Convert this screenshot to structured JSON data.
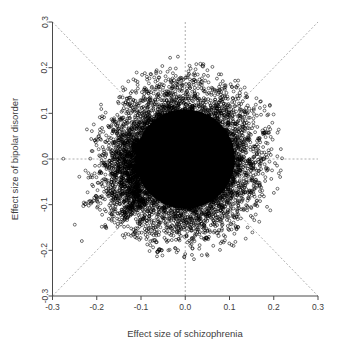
{
  "chart_data": {
    "type": "scatter",
    "title": "",
    "xlabel": "Effect size of schizophrenia",
    "ylabel": "Effect size of bipolar disorder",
    "xlim": [
      -0.3,
      0.3
    ],
    "ylim": [
      -0.3,
      0.3
    ],
    "xticks": [
      -0.3,
      -0.2,
      -0.1,
      0.0,
      0.1,
      0.2,
      0.3
    ],
    "yticks": [
      -0.3,
      -0.2,
      -0.1,
      0.0,
      0.1,
      0.2,
      0.3
    ],
    "xtick_labels": [
      "-0.3",
      "-0.2",
      "-0.1",
      "0.0",
      "0.1",
      "0.2",
      "0.3"
    ],
    "ytick_labels": [
      "-0.3",
      "-0.2",
      "-0.1",
      "0.0",
      "0.1",
      "0.2",
      "0.3"
    ],
    "grid": false,
    "legend": null,
    "marker": "open-circle",
    "marker_color": "#000000",
    "reference_lines": [
      {
        "name": "vertical-zero",
        "type": "vline",
        "value": 0.0,
        "style": "dashed",
        "color": "#9a9a9a"
      },
      {
        "name": "horizontal-zero",
        "type": "hline",
        "value": 0.0,
        "style": "dashed",
        "color": "#9a9a9a"
      },
      {
        "name": "identity-diagonal",
        "type": "abline",
        "slope": 1,
        "intercept": 0.0,
        "style": "dashed",
        "color": "#9a9a9a"
      },
      {
        "name": "antidiagonal",
        "type": "abline",
        "slope": -1,
        "intercept": 0.0,
        "style": "dashed",
        "color": "#9a9a9a"
      }
    ],
    "cloud": {
      "center": [
        0.0,
        0.0
      ],
      "core_radius": 0.112,
      "halo_radius": 0.225,
      "n_points_approx": 9000
    },
    "notable_points": [
      {
        "x": 0.04,
        "y": 0.203,
        "note": "isolated high-bipolar outlier"
      },
      {
        "x": -0.215,
        "y": -0.092,
        "note": "left-hand satellite cluster"
      },
      {
        "x": -0.225,
        "y": -0.098,
        "note": "left-hand satellite cluster"
      },
      {
        "x": -0.205,
        "y": -0.085,
        "note": "left-hand satellite cluster"
      },
      {
        "x": -0.178,
        "y": -0.07,
        "note": "left-hand satellite cluster"
      },
      {
        "x": -0.168,
        "y": -0.062,
        "note": "left-hand satellite cluster"
      },
      {
        "x": 0.175,
        "y": 0.062,
        "note": "right-hand satellite"
      },
      {
        "x": 0.182,
        "y": 0.058,
        "note": "right-hand satellite"
      },
      {
        "x": 0.172,
        "y": -0.002,
        "note": "right-hand satellite near zero"
      },
      {
        "x": 0.178,
        "y": 0.0,
        "note": "right-hand satellite near zero"
      },
      {
        "x": 0.165,
        "y": -0.052,
        "note": "right-hand satellite"
      },
      {
        "x": 0.168,
        "y": -0.06,
        "note": "right-hand satellite"
      },
      {
        "x": -0.062,
        "y": -0.203,
        "note": "low-bipolar outlier"
      },
      {
        "x": -0.058,
        "y": -0.198,
        "note": "low-bipolar outlier"
      },
      {
        "x": -0.068,
        "y": -0.178,
        "note": "low-bipolar outlier"
      },
      {
        "x": -0.118,
        "y": -0.165,
        "note": "low-bipolar outlier"
      },
      {
        "x": -0.112,
        "y": -0.158,
        "note": "low-bipolar outlier"
      },
      {
        "x": 0.048,
        "y": -0.172,
        "note": "low-bipolar outlier"
      },
      {
        "x": 0.072,
        "y": -0.162,
        "note": "low-bipolar outlier"
      },
      {
        "x": 0.038,
        "y": 0.168,
        "note": "high-bipolar outlier"
      },
      {
        "x": -0.032,
        "y": 0.168,
        "note": "high-bipolar outlier"
      },
      {
        "x": 0.118,
        "y": 0.138,
        "note": "upper-right outlier"
      },
      {
        "x": 0.138,
        "y": 0.112,
        "note": "upper-right outlier"
      },
      {
        "x": -0.145,
        "y": 0.085,
        "note": "upper-left outlier"
      },
      {
        "x": -0.152,
        "y": 0.078,
        "note": "upper-left outlier"
      }
    ]
  },
  "figure": {
    "xlabel": "Effect size of schizophrenia",
    "ylabel": "Effect size of bipolar disorder"
  }
}
